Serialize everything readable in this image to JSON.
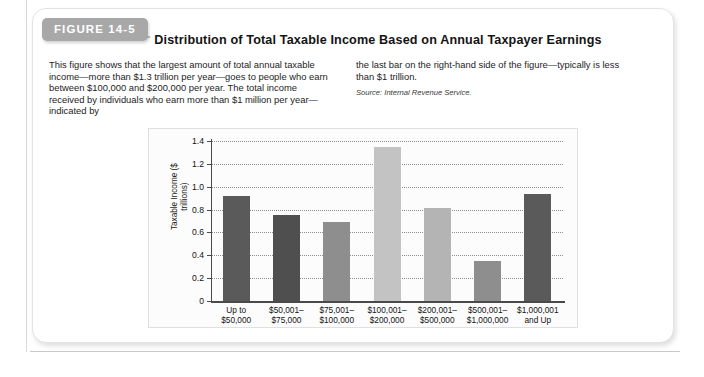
{
  "figure": {
    "tab_label": "FIGURE 14-5",
    "title": "Distribution of Total Taxable Income Based on Annual Taxpayer Earnings",
    "caption_left": "This figure shows that the largest amount of total annual taxable income—more than $1.3 trillion per year—goes to people who earn between $100,000 and $200,000 per year. The total income received by individuals who earn more than $1 million per year—indicated by",
    "caption_right": "the last bar on the right-hand side of the figure—typically is less than $1 trillion.",
    "source": "Source: Internal Revenue Service."
  },
  "colors": {
    "tab_background": "#a8a8a8",
    "bar_dark": "#5a5a5a",
    "bar_darkest": "#4f4f4f",
    "bar_medium": "#8e8e8e",
    "bar_light": "#b4b4b4",
    "bar_lightest": "#c3c3c3",
    "axis": "#4a4a4a",
    "gridline": "#8f8f8f",
    "panel_background": "#fcfcfc"
  },
  "chart_data": {
    "type": "bar",
    "title": "Distribution of Total Taxable Income Based on Annual Taxpayer Earnings",
    "xlabel": "",
    "ylabel": "Taxable Income ($ trillions)",
    "ylabel_line1": "Taxable Income",
    "ylabel_line2": "($ trillions)",
    "ylim": [
      0,
      1.4
    ],
    "ytick_labels": [
      "1.4",
      "1.2",
      "1.0",
      "0.8",
      "0.6",
      "0.4",
      "0.2",
      "0"
    ],
    "ytick_values": [
      1.4,
      1.2,
      1.0,
      0.8,
      0.6,
      0.4,
      0.2,
      0
    ],
    "grid": true,
    "grid_style": "dotted-horizontal",
    "legend": "none",
    "categories": [
      "Up to $50,000",
      "$50,001–$75,000",
      "$75,001–$100,000",
      "$100,001–$200,000",
      "$200,001–$500,000",
      "$500,001–$1,000,000",
      "$1,000,001 and Up"
    ],
    "category_lines": [
      [
        "Up to",
        "$50,000"
      ],
      [
        "$50,001–",
        "$75,000"
      ],
      [
        "$75,001–",
        "$100,000"
      ],
      [
        "$100,001–",
        "$200,000"
      ],
      [
        "$200,001–",
        "$500,000"
      ],
      [
        "$500,001–",
        "$1,000,000"
      ],
      [
        "$1,000,001",
        "and Up"
      ]
    ],
    "values": [
      0.92,
      0.755,
      0.69,
      1.345,
      0.81,
      0.35,
      0.94
    ],
    "bar_colors": [
      "#5a5a5a",
      "#4f4f4f",
      "#8e8e8e",
      "#c3c3c3",
      "#b4b4b4",
      "#8e8e8e",
      "#5a5a5a"
    ]
  }
}
